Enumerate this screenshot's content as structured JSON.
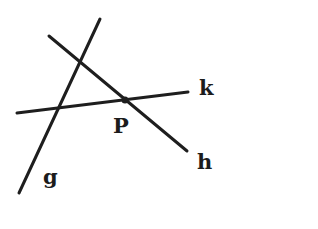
{
  "diagram": {
    "type": "geometry-lines",
    "background": "#ffffff",
    "stroke_color": "#1e1e1e",
    "lines": [
      {
        "name": "g",
        "label": "g",
        "x1": 100,
        "y1": 19,
        "x2": 19,
        "y2": 193
      },
      {
        "name": "h",
        "label": "h",
        "x1": 49,
        "y1": 36,
        "x2": 187,
        "y2": 151
      },
      {
        "name": "k",
        "label": "k",
        "x1": 17,
        "y1": 113,
        "x2": 188,
        "y2": 92
      }
    ],
    "point": {
      "name": "P",
      "label": "P",
      "x": 125,
      "y": 100,
      "on_lines": [
        "h",
        "k"
      ]
    },
    "labels": {
      "g": "g",
      "h": "h",
      "k": "k",
      "P": "P"
    }
  }
}
